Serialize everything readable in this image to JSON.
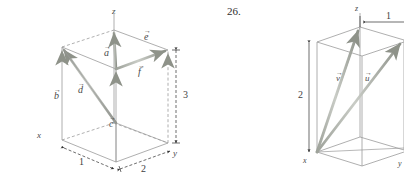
{
  "page": {
    "background_color": "#ffffff",
    "ink_color": "#4a4a4a",
    "vector_color": "#9a9e96",
    "vector_edge_color": "#6f7370",
    "dimension_color": "#3f3f3f",
    "top_cut_text": "· · · · · · · · · · ·"
  },
  "figures": [
    {
      "id": "figure-left",
      "problem_number": "",
      "type": "3d-box-vector-diagram",
      "axes": [
        {
          "name": "z-axis",
          "label": "z"
        },
        {
          "name": "x-axis",
          "label": "x"
        },
        {
          "name": "y-axis",
          "label": "y"
        }
      ],
      "vectors": [
        {
          "name": "vector-a",
          "label": "a"
        },
        {
          "name": "vector-b",
          "label": "b"
        },
        {
          "name": "vector-c",
          "label": "c"
        },
        {
          "name": "vector-d",
          "label": "d"
        },
        {
          "name": "vector-e",
          "label": "e"
        },
        {
          "name": "vector-f",
          "label": "f"
        }
      ],
      "dimensions": [
        {
          "name": "dimension-depth",
          "value": "1"
        },
        {
          "name": "dimension-width",
          "value": "2"
        },
        {
          "name": "dimension-height",
          "value": "3"
        }
      ]
    },
    {
      "id": "figure-right",
      "problem_number": "26.",
      "type": "3d-box-vector-diagram",
      "axes": [
        {
          "name": "z-axis",
          "label": "z"
        },
        {
          "name": "x-axis",
          "label": "x"
        },
        {
          "name": "y-axis",
          "label": "y"
        }
      ],
      "vectors": [
        {
          "name": "vector-v",
          "label": "v"
        },
        {
          "name": "vector-u",
          "label": "u"
        }
      ],
      "dimensions": [
        {
          "name": "dimension-height",
          "value": "2"
        },
        {
          "name": "dimension-top-width",
          "value": "1"
        }
      ]
    }
  ]
}
